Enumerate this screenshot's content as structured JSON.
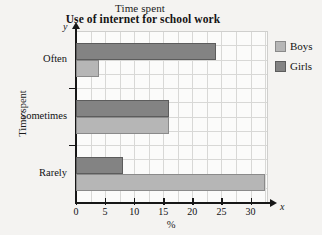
{
  "header": {
    "supertitle": "Time spent",
    "title": "Use of internet for school work"
  },
  "axes": {
    "y_caption": "Time spent",
    "x_caption": "%",
    "y_axis_letter": "y",
    "x_axis_letter": "x"
  },
  "legend": {
    "position": "right",
    "items": [
      {
        "label": "Boys",
        "color": "#b6b6b6",
        "swatch": "boys"
      },
      {
        "label": "Girls",
        "color": "#838383",
        "swatch": "girls"
      }
    ]
  },
  "chart_data": {
    "type": "bar",
    "orientation": "horizontal",
    "title": "Use of internet for school work",
    "supertitle": "Time spent",
    "xlabel": "%",
    "ylabel": "Time spent",
    "categories": [
      "Often",
      "Sometimes",
      "Rarely"
    ],
    "series": [
      {
        "name": "Boys",
        "color": "#b6b6b6",
        "values": [
          4,
          16,
          32.5
        ]
      },
      {
        "name": "Girls",
        "color": "#838383",
        "values": [
          24,
          16,
          8
        ]
      }
    ],
    "xlim": [
      0,
      33
    ],
    "xticks": [
      0,
      5,
      10,
      15,
      20,
      25,
      30
    ],
    "xticklabels": [
      "0",
      "5",
      "10",
      "15",
      "20",
      "25",
      "30"
    ],
    "grid": true,
    "grid_step": 2.5,
    "legend_position": "right"
  }
}
